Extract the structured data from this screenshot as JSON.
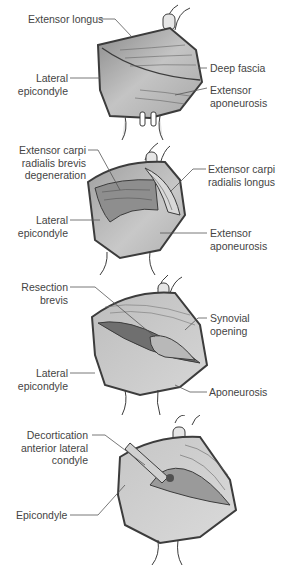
{
  "figure": {
    "panels": [
      {
        "id": "A",
        "labels": {
          "extensor_longus": "Extensor longus",
          "lateral_epicondyle": [
            "Lateral",
            "epicondyle"
          ],
          "deep_fascia": "Deep fascia",
          "extensor_aponeurosis": [
            "Extensor",
            "aponeurosis"
          ]
        }
      },
      {
        "id": "B",
        "labels": {
          "ecrb_degeneration": [
            "Extensor carpi",
            "radialis brevis",
            "degeneration"
          ],
          "ecrl": [
            "Extensor carpi",
            "radialis longus"
          ],
          "lateral_epicondyle": [
            "Lateral",
            "epicondyle"
          ],
          "extensor_aponeurosis": [
            "Extensor",
            "aponeurosis"
          ]
        }
      },
      {
        "id": "C",
        "labels": {
          "resection_brevis": [
            "Resection",
            "brevis"
          ],
          "synovial_opening": [
            "Synovial",
            "opening"
          ],
          "lateral_epicondyle": [
            "Lateral",
            "epicondyle"
          ],
          "aponeurosis": "Aponeurosis"
        }
      },
      {
        "id": "D",
        "labels": {
          "decortication": [
            "Decortication",
            "anterior lateral",
            "condyle"
          ],
          "epicondyle": "Epicondyle"
        }
      }
    ],
    "colors": {
      "outline": "#3c3c3c",
      "tissue_dark": "#8c8c8c",
      "tissue_mid": "#b4b4b4",
      "tissue_light": "#d2d2d2",
      "leader": "#555555"
    }
  }
}
